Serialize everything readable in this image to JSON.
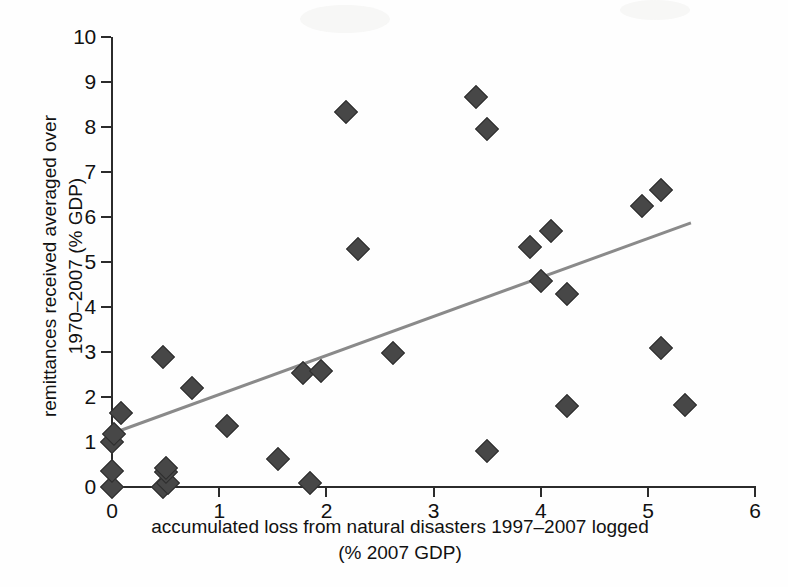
{
  "chart_data": {
    "type": "scatter",
    "title": "",
    "xlabel": "accumulated loss from natural disasters  1997–2007 logged (% 2007 GDP)",
    "xlabel_line1": "accumulated loss from natural disasters  1997–2007 logged",
    "xlabel_line2": "(% 2007 GDP)",
    "ylabel": "remittances received averaged over 1970–2007 (% GDP)",
    "ylabel_line1": "remittances received averaged over",
    "ylabel_line2": "1970–2007 (% GDP)",
    "xlim": [
      0,
      6
    ],
    "ylim": [
      0,
      10
    ],
    "xticks": [
      0,
      1,
      2,
      3,
      4,
      5,
      6
    ],
    "xtick_labels": [
      "0",
      "1",
      "2",
      "3",
      "4",
      "5",
      "6"
    ],
    "yticks": [
      0,
      1,
      2,
      3,
      4,
      5,
      6,
      7,
      8,
      9,
      10
    ],
    "ytick_labels": [
      "0",
      "1",
      "2",
      "3",
      "4",
      "5",
      "6",
      "7",
      "8",
      "9",
      "10"
    ],
    "grid": false,
    "legend": false,
    "marker": "diamond",
    "marker_color": "#474747",
    "trendline": {
      "present": true,
      "color": "#8a8a8a",
      "x_start": 0.0,
      "y_start": 1.2,
      "x_end": 5.4,
      "y_end": 5.88
    },
    "points": [
      {
        "x": 0.0,
        "y": 0.0
      },
      {
        "x": 0.0,
        "y": 0.35
      },
      {
        "x": 0.0,
        "y": 1.0
      },
      {
        "x": 0.02,
        "y": 1.18
      },
      {
        "x": 0.08,
        "y": 1.65
      },
      {
        "x": 0.48,
        "y": 0.0
      },
      {
        "x": 0.52,
        "y": 0.1
      },
      {
        "x": 0.5,
        "y": 0.33
      },
      {
        "x": 0.5,
        "y": 0.42
      },
      {
        "x": 0.48,
        "y": 2.9
      },
      {
        "x": 0.75,
        "y": 2.2
      },
      {
        "x": 1.07,
        "y": 1.35
      },
      {
        "x": 1.55,
        "y": 0.63
      },
      {
        "x": 1.85,
        "y": 0.08
      },
      {
        "x": 1.78,
        "y": 2.53
      },
      {
        "x": 1.95,
        "y": 2.57
      },
      {
        "x": 2.18,
        "y": 8.33
      },
      {
        "x": 2.3,
        "y": 5.3
      },
      {
        "x": 2.62,
        "y": 2.97
      },
      {
        "x": 3.4,
        "y": 8.67
      },
      {
        "x": 3.5,
        "y": 7.95
      },
      {
        "x": 3.5,
        "y": 0.8
      },
      {
        "x": 3.9,
        "y": 5.33
      },
      {
        "x": 4.0,
        "y": 4.57
      },
      {
        "x": 4.1,
        "y": 5.7
      },
      {
        "x": 4.25,
        "y": 4.3
      },
      {
        "x": 4.25,
        "y": 1.8
      },
      {
        "x": 4.95,
        "y": 6.25
      },
      {
        "x": 5.12,
        "y": 6.6
      },
      {
        "x": 5.12,
        "y": 3.08
      },
      {
        "x": 5.35,
        "y": 1.83
      }
    ]
  }
}
